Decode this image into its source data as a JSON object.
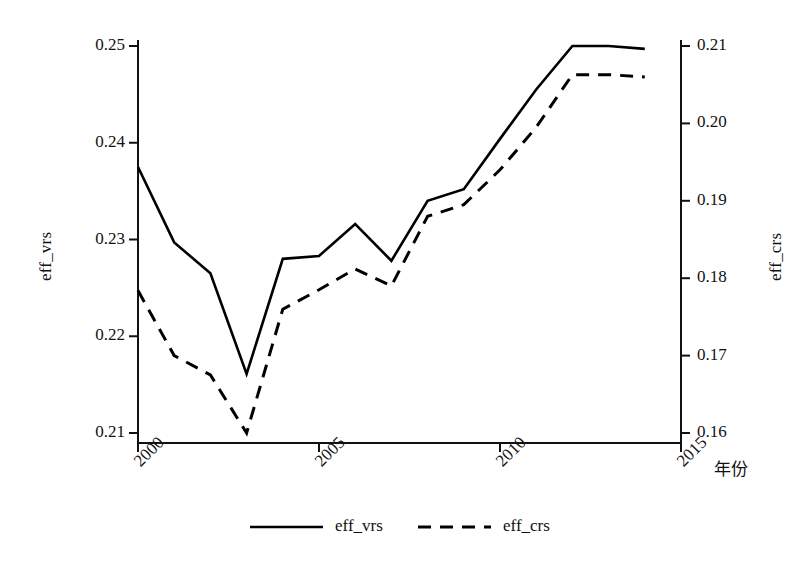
{
  "chart_data": {
    "type": "line",
    "title": "",
    "xlabel": "年份",
    "ylabel": "eff_vrs",
    "ylabel_right": "eff_crs",
    "x": [
      2000,
      2001,
      2002,
      2003,
      2004,
      2005,
      2006,
      2007,
      2008,
      2009,
      2010,
      2011,
      2012,
      2013,
      2014
    ],
    "xlim": [
      2000,
      2015
    ],
    "xticks": [
      2000,
      2005,
      2010,
      2015
    ],
    "xtick_labels": [
      "2000",
      "2005",
      "2010",
      "2015"
    ],
    "ylim": [
      0.21,
      0.25
    ],
    "yticks": [
      0.21,
      0.22,
      0.23,
      0.24,
      0.25
    ],
    "ytick_labels": [
      "0.21",
      "0.22",
      "0.23",
      "0.24",
      "0.25"
    ],
    "ylim_right": [
      0.16,
      0.21
    ],
    "yticks_right": [
      0.16,
      0.17,
      0.18,
      0.19,
      0.2,
      0.21
    ],
    "ytick_labels_right": [
      "0.16",
      "0.17",
      "0.18",
      "0.19",
      "0.20",
      "0.21"
    ],
    "grid": false,
    "legend_position": "bottom-center",
    "series": [
      {
        "name": "eff_vrs",
        "axis": "left",
        "style": "solid",
        "color": "#000000",
        "values": [
          0.2375,
          0.2297,
          0.2265,
          0.2161,
          0.228,
          0.2283,
          0.2316,
          0.2278,
          0.234,
          0.2352,
          0.2404,
          0.2455,
          0.25,
          0.25,
          0.2497
        ]
      },
      {
        "name": "eff_crs",
        "axis": "right",
        "style": "dashed",
        "color": "#000000",
        "values": [
          0.1784,
          0.17,
          0.1675,
          0.16,
          0.176,
          0.1785,
          0.1812,
          0.179,
          0.188,
          0.1895,
          0.194,
          0.1995,
          0.2063,
          0.2063,
          0.206
        ]
      }
    ]
  },
  "legend": {
    "items": [
      {
        "label": "eff_vrs",
        "style": "solid"
      },
      {
        "label": "eff_crs",
        "style": "dashed"
      }
    ]
  },
  "axes": {
    "left_title": "eff_vrs",
    "right_title": "eff_crs",
    "x_title": "年份"
  }
}
